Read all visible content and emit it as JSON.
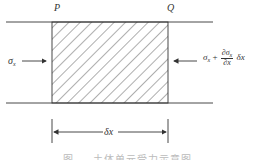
{
  "diagram": {
    "labels": {
      "left_point": "P",
      "right_point": "Q",
      "left_stress": "σ",
      "left_stress_sub": "x",
      "right_stress_base": "σ",
      "right_stress_sub": "x",
      "right_plus": "+",
      "right_frac_num": "∂σ",
      "right_frac_num_sub": "x",
      "right_frac_den": "∂x",
      "right_tail": "δx",
      "width_label": "δx"
    },
    "caption": "图 — 土体单元受力示意图",
    "colors": {
      "line": "#333333",
      "hatch": "#333333",
      "caption": "#bbbbbb"
    }
  }
}
